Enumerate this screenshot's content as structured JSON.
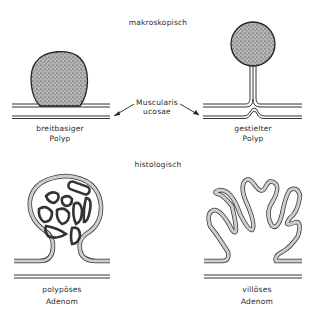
{
  "sections": {
    "top_heading": "makroskopisch",
    "bottom_heading": "histologisch"
  },
  "macroscopic": {
    "left": {
      "line1": "breitbasiger",
      "line2": "Polyp"
    },
    "right": {
      "line1": "gestielter",
      "line2": "Polyp"
    },
    "pointer_label": {
      "line1": "Muscularis",
      "line2": "ucosae"
    }
  },
  "histological": {
    "left": {
      "line1": "polypöses",
      "line2": "Adenom"
    },
    "right": {
      "line1": "villöses",
      "line2": "Adenom"
    }
  },
  "colors": {
    "ink": "#2a2a2a",
    "stipple_fill": "#9a9a9a",
    "background": "#ffffff"
  }
}
